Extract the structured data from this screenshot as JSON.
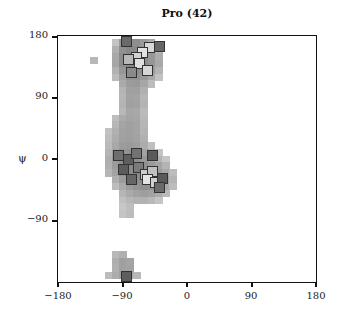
{
  "chart_data": {
    "type": "heatmap",
    "title": "Pro (42)",
    "xlabel": "",
    "ylabel": "ψ",
    "xlim": [
      -180,
      180
    ],
    "ylim": [
      -180,
      180
    ],
    "xticks": [
      -180,
      -90,
      0,
      90,
      180
    ],
    "yticks": [
      180,
      90,
      0,
      -90
    ],
    "cell_size_deg": 10,
    "background_density": [
      {
        "phi": -130,
        "psi": 145,
        "shade": "#b8b8b8"
      },
      {
        "phi": -100,
        "psi": 170,
        "shade": "#c4c4c4"
      },
      {
        "phi": -90,
        "psi": 170,
        "shade": "#9a9a9a"
      },
      {
        "phi": -80,
        "psi": 170,
        "shade": "#8e8e8e"
      },
      {
        "phi": -70,
        "psi": 170,
        "shade": "#8e8e8e"
      },
      {
        "phi": -60,
        "psi": 170,
        "shade": "#9a9a9a"
      },
      {
        "phi": -50,
        "psi": 170,
        "shade": "#a8a8a8"
      },
      {
        "phi": -100,
        "psi": 160,
        "shade": "#b0b0b0"
      },
      {
        "phi": -90,
        "psi": 160,
        "shade": "#909090"
      },
      {
        "phi": -80,
        "psi": 160,
        "shade": "#888888"
      },
      {
        "phi": -70,
        "psi": 160,
        "shade": "#8a8a8a"
      },
      {
        "phi": -60,
        "psi": 160,
        "shade": "#8e8e8e"
      },
      {
        "phi": -50,
        "psi": 160,
        "shade": "#9c9c9c"
      },
      {
        "phi": -40,
        "psi": 160,
        "shade": "#b8b8b8"
      },
      {
        "phi": -100,
        "psi": 150,
        "shade": "#a8a8a8"
      },
      {
        "phi": -90,
        "psi": 150,
        "shade": "#8c8c8c"
      },
      {
        "phi": -80,
        "psi": 150,
        "shade": "#888888"
      },
      {
        "phi": -70,
        "psi": 150,
        "shade": "#8a8a8a"
      },
      {
        "phi": -60,
        "psi": 150,
        "shade": "#8c8c8c"
      },
      {
        "phi": -50,
        "psi": 150,
        "shade": "#989898"
      },
      {
        "phi": -40,
        "psi": 150,
        "shade": "#acacac"
      },
      {
        "phi": -100,
        "psi": 140,
        "shade": "#a6a6a6"
      },
      {
        "phi": -90,
        "psi": 140,
        "shade": "#8c8c8c"
      },
      {
        "phi": -80,
        "psi": 140,
        "shade": "#888888"
      },
      {
        "phi": -70,
        "psi": 140,
        "shade": "#8a8a8a"
      },
      {
        "phi": -60,
        "psi": 140,
        "shade": "#8c8c8c"
      },
      {
        "phi": -50,
        "psi": 140,
        "shade": "#969696"
      },
      {
        "phi": -40,
        "psi": 140,
        "shade": "#a8a8a8"
      },
      {
        "phi": -100,
        "psi": 130,
        "shade": "#b2b2b2"
      },
      {
        "phi": -90,
        "psi": 130,
        "shade": "#969696"
      },
      {
        "phi": -80,
        "psi": 130,
        "shade": "#8c8c8c"
      },
      {
        "phi": -70,
        "psi": 130,
        "shade": "#8c8c8c"
      },
      {
        "phi": -60,
        "psi": 130,
        "shade": "#8e8e8e"
      },
      {
        "phi": -50,
        "psi": 130,
        "shade": "#9e9e9e"
      },
      {
        "phi": -40,
        "psi": 130,
        "shade": "#b4b4b4"
      },
      {
        "phi": -100,
        "psi": 120,
        "shade": "#bcbcbc"
      },
      {
        "phi": -90,
        "psi": 120,
        "shade": "#a0a0a0"
      },
      {
        "phi": -80,
        "psi": 120,
        "shade": "#949494"
      },
      {
        "phi": -70,
        "psi": 120,
        "shade": "#929292"
      },
      {
        "phi": -60,
        "psi": 120,
        "shade": "#989898"
      },
      {
        "phi": -50,
        "psi": 120,
        "shade": "#a8a8a8"
      },
      {
        "phi": -40,
        "psi": 120,
        "shade": "#c2c2c2"
      },
      {
        "phi": -90,
        "psi": 110,
        "shade": "#aaaaaa"
      },
      {
        "phi": -80,
        "psi": 110,
        "shade": "#9c9c9c"
      },
      {
        "phi": -70,
        "psi": 110,
        "shade": "#9a9a9a"
      },
      {
        "phi": -60,
        "psi": 110,
        "shade": "#a6a6a6"
      },
      {
        "phi": -50,
        "psi": 110,
        "shade": "#bcbcbc"
      },
      {
        "phi": -90,
        "psi": 100,
        "shade": "#b4b4b4"
      },
      {
        "phi": -80,
        "psi": 100,
        "shade": "#a0a0a0"
      },
      {
        "phi": -70,
        "psi": 100,
        "shade": "#a0a0a0"
      },
      {
        "phi": -60,
        "psi": 100,
        "shade": "#b0b0b0"
      },
      {
        "phi": -90,
        "psi": 90,
        "shade": "#b6b6b6"
      },
      {
        "phi": -80,
        "psi": 90,
        "shade": "#a2a2a2"
      },
      {
        "phi": -70,
        "psi": 90,
        "shade": "#a4a4a4"
      },
      {
        "phi": -60,
        "psi": 90,
        "shade": "#b6b6b6"
      },
      {
        "phi": -90,
        "psi": 80,
        "shade": "#b4b4b4"
      },
      {
        "phi": -80,
        "psi": 80,
        "shade": "#a0a0a0"
      },
      {
        "phi": -70,
        "psi": 80,
        "shade": "#a2a2a2"
      },
      {
        "phi": -60,
        "psi": 80,
        "shade": "#b4b4b4"
      },
      {
        "phi": -90,
        "psi": 70,
        "shade": "#b8b8b8"
      },
      {
        "phi": -80,
        "psi": 70,
        "shade": "#a6a6a6"
      },
      {
        "phi": -70,
        "psi": 70,
        "shade": "#a8a8a8"
      },
      {
        "phi": -60,
        "psi": 70,
        "shade": "#bababa"
      },
      {
        "phi": -100,
        "psi": 60,
        "shade": "#bebebe"
      },
      {
        "phi": -90,
        "psi": 60,
        "shade": "#aaaaaa"
      },
      {
        "phi": -80,
        "psi": 60,
        "shade": "#a4a4a4"
      },
      {
        "phi": -70,
        "psi": 60,
        "shade": "#a6a6a6"
      },
      {
        "phi": -60,
        "psi": 60,
        "shade": "#b8b8b8"
      },
      {
        "phi": -100,
        "psi": 50,
        "shade": "#b6b6b6"
      },
      {
        "phi": -90,
        "psi": 50,
        "shade": "#a4a4a4"
      },
      {
        "phi": -80,
        "psi": 50,
        "shade": "#a0a0a0"
      },
      {
        "phi": -70,
        "psi": 50,
        "shade": "#a4a4a4"
      },
      {
        "phi": -60,
        "psi": 50,
        "shade": "#b6b6b6"
      },
      {
        "phi": -110,
        "psi": 40,
        "shade": "#c2c2c2"
      },
      {
        "phi": -100,
        "psi": 40,
        "shade": "#b0b0b0"
      },
      {
        "phi": -90,
        "psi": 40,
        "shade": "#a2a2a2"
      },
      {
        "phi": -80,
        "psi": 40,
        "shade": "#a0a0a0"
      },
      {
        "phi": -70,
        "psi": 40,
        "shade": "#a4a4a4"
      },
      {
        "phi": -60,
        "psi": 40,
        "shade": "#b4b4b4"
      },
      {
        "phi": -110,
        "psi": 30,
        "shade": "#bebebe"
      },
      {
        "phi": -100,
        "psi": 30,
        "shade": "#acacac"
      },
      {
        "phi": -90,
        "psi": 30,
        "shade": "#a0a0a0"
      },
      {
        "phi": -80,
        "psi": 30,
        "shade": "#9e9e9e"
      },
      {
        "phi": -70,
        "psi": 30,
        "shade": "#a2a2a2"
      },
      {
        "phi": -60,
        "psi": 30,
        "shade": "#b0b0b0"
      },
      {
        "phi": -110,
        "psi": 20,
        "shade": "#bababa"
      },
      {
        "phi": -100,
        "psi": 20,
        "shade": "#a8a8a8"
      },
      {
        "phi": -90,
        "psi": 20,
        "shade": "#9c9c9c"
      },
      {
        "phi": -80,
        "psi": 20,
        "shade": "#9a9a9a"
      },
      {
        "phi": -70,
        "psi": 20,
        "shade": "#9e9e9e"
      },
      {
        "phi": -60,
        "psi": 20,
        "shade": "#acacac"
      },
      {
        "phi": -50,
        "psi": 20,
        "shade": "#c0c0c0"
      },
      {
        "phi": -110,
        "psi": 10,
        "shade": "#b4b4b4"
      },
      {
        "phi": -100,
        "psi": 10,
        "shade": "#a0a0a0"
      },
      {
        "phi": -90,
        "psi": 10,
        "shade": "#949494"
      },
      {
        "phi": -80,
        "psi": 10,
        "shade": "#929292"
      },
      {
        "phi": -70,
        "psi": 10,
        "shade": "#969696"
      },
      {
        "phi": -60,
        "psi": 10,
        "shade": "#a2a2a2"
      },
      {
        "phi": -50,
        "psi": 10,
        "shade": "#b2b2b2"
      },
      {
        "phi": -40,
        "psi": 10,
        "shade": "#c4c4c4"
      },
      {
        "phi": -110,
        "psi": 0,
        "shade": "#aeaeae"
      },
      {
        "phi": -100,
        "psi": 0,
        "shade": "#9a9a9a"
      },
      {
        "phi": -90,
        "psi": 0,
        "shade": "#8e8e8e"
      },
      {
        "phi": -80,
        "psi": 0,
        "shade": "#8a8a8a"
      },
      {
        "phi": -70,
        "psi": 0,
        "shade": "#8e8e8e"
      },
      {
        "phi": -60,
        "psi": 0,
        "shade": "#989898"
      },
      {
        "phi": -50,
        "psi": 0,
        "shade": "#a6a6a6"
      },
      {
        "phi": -40,
        "psi": 0,
        "shade": "#b4b4b4"
      },
      {
        "phi": -30,
        "psi": 0,
        "shade": "#c6c6c6"
      },
      {
        "phi": -110,
        "psi": -10,
        "shade": "#b0b0b0"
      },
      {
        "phi": -100,
        "psi": -10,
        "shade": "#9c9c9c"
      },
      {
        "phi": -90,
        "psi": -10,
        "shade": "#8e8e8e"
      },
      {
        "phi": -80,
        "psi": -10,
        "shade": "#888888"
      },
      {
        "phi": -70,
        "psi": -10,
        "shade": "#8a8a8a"
      },
      {
        "phi": -60,
        "psi": -10,
        "shade": "#909090"
      },
      {
        "phi": -50,
        "psi": -10,
        "shade": "#9a9a9a"
      },
      {
        "phi": -40,
        "psi": -10,
        "shade": "#a4a4a4"
      },
      {
        "phi": -30,
        "psi": -10,
        "shade": "#b4b4b4"
      },
      {
        "phi": -110,
        "psi": -20,
        "shade": "#b6b6b6"
      },
      {
        "phi": -100,
        "psi": -20,
        "shade": "#a2a2a2"
      },
      {
        "phi": -90,
        "psi": -20,
        "shade": "#929292"
      },
      {
        "phi": -80,
        "psi": -20,
        "shade": "#8a8a8a"
      },
      {
        "phi": -70,
        "psi": -20,
        "shade": "#8a8a8a"
      },
      {
        "phi": -60,
        "psi": -20,
        "shade": "#8c8c8c"
      },
      {
        "phi": -50,
        "psi": -20,
        "shade": "#929292"
      },
      {
        "phi": -40,
        "psi": -20,
        "shade": "#9c9c9c"
      },
      {
        "phi": -30,
        "psi": -20,
        "shade": "#a8a8a8"
      },
      {
        "phi": -20,
        "psi": -20,
        "shade": "#bcbcbc"
      },
      {
        "phi": -100,
        "psi": -30,
        "shade": "#aeaeae"
      },
      {
        "phi": -90,
        "psi": -30,
        "shade": "#9c9c9c"
      },
      {
        "phi": -80,
        "psi": -30,
        "shade": "#909090"
      },
      {
        "phi": -70,
        "psi": -30,
        "shade": "#8c8c8c"
      },
      {
        "phi": -60,
        "psi": -30,
        "shade": "#8a8a8a"
      },
      {
        "phi": -50,
        "psi": -30,
        "shade": "#8e8e8e"
      },
      {
        "phi": -40,
        "psi": -30,
        "shade": "#969696"
      },
      {
        "phi": -30,
        "psi": -30,
        "shade": "#a2a2a2"
      },
      {
        "phi": -20,
        "psi": -30,
        "shade": "#b4b4b4"
      },
      {
        "phi": -100,
        "psi": -40,
        "shade": "#bcbcbc"
      },
      {
        "phi": -90,
        "psi": -40,
        "shade": "#aaaaaa"
      },
      {
        "phi": -80,
        "psi": -40,
        "shade": "#9c9c9c"
      },
      {
        "phi": -70,
        "psi": -40,
        "shade": "#949494"
      },
      {
        "phi": -60,
        "psi": -40,
        "shade": "#909090"
      },
      {
        "phi": -50,
        "psi": -40,
        "shade": "#929292"
      },
      {
        "phi": -40,
        "psi": -40,
        "shade": "#9a9a9a"
      },
      {
        "phi": -30,
        "psi": -40,
        "shade": "#a8a8a8"
      },
      {
        "phi": -20,
        "psi": -40,
        "shade": "#bcbcbc"
      },
      {
        "phi": -90,
        "psi": -50,
        "shade": "#b6b6b6"
      },
      {
        "phi": -80,
        "psi": -50,
        "shade": "#aaaaaa"
      },
      {
        "phi": -70,
        "psi": -50,
        "shade": "#a2a2a2"
      },
      {
        "phi": -60,
        "psi": -50,
        "shade": "#9e9e9e"
      },
      {
        "phi": -50,
        "psi": -50,
        "shade": "#a2a2a2"
      },
      {
        "phi": -40,
        "psi": -50,
        "shade": "#acacac"
      },
      {
        "phi": -30,
        "psi": -50,
        "shade": "#bababa"
      },
      {
        "phi": -90,
        "psi": -60,
        "shade": "#c0c0c0"
      },
      {
        "phi": -80,
        "psi": -60,
        "shade": "#b6b6b6"
      },
      {
        "phi": -70,
        "psi": -60,
        "shade": "#b2b2b2"
      },
      {
        "phi": -60,
        "psi": -60,
        "shade": "#b2b2b2"
      },
      {
        "phi": -50,
        "psi": -60,
        "shade": "#b8b8b8"
      },
      {
        "phi": -40,
        "psi": -60,
        "shade": "#c4c4c4"
      },
      {
        "phi": -90,
        "psi": -70,
        "shade": "#c6c6c6"
      },
      {
        "phi": -80,
        "psi": -70,
        "shade": "#bebebe"
      },
      {
        "phi": -90,
        "psi": -80,
        "shade": "#c4c4c4"
      },
      {
        "phi": -80,
        "psi": -80,
        "shade": "#bcbcbc"
      },
      {
        "phi": -100,
        "psi": -140,
        "shade": "#b8b8b8"
      },
      {
        "phi": -90,
        "psi": -140,
        "shade": "#b0b0b0"
      },
      {
        "phi": -100,
        "psi": -150,
        "shade": "#aeaeae"
      },
      {
        "phi": -90,
        "psi": -150,
        "shade": "#a0a0a0"
      },
      {
        "phi": -80,
        "psi": -150,
        "shade": "#a4a4a4"
      },
      {
        "phi": -100,
        "psi": -160,
        "shade": "#b0b0b0"
      },
      {
        "phi": -90,
        "psi": -160,
        "shade": "#a0a0a0"
      },
      {
        "phi": -80,
        "psi": -160,
        "shade": "#a2a2a2"
      },
      {
        "phi": -110,
        "psi": -170,
        "shade": "#bcbcbc"
      },
      {
        "phi": -100,
        "psi": -170,
        "shade": "#acacac"
      },
      {
        "phi": -90,
        "psi": -170,
        "shade": "#a0a0a0"
      },
      {
        "phi": -80,
        "psi": -170,
        "shade": "#a6a6a6"
      },
      {
        "phi": -70,
        "psi": -170,
        "shade": "#b8b8b8"
      }
    ],
    "highlight_squares": [
      {
        "phi": -85,
        "psi": 172,
        "fill": "#6a6a6a"
      },
      {
        "phi": -52,
        "psi": 163,
        "fill": "#d8d8d8"
      },
      {
        "phi": -38,
        "psi": 165,
        "fill": "#666666"
      },
      {
        "phi": -62,
        "psi": 156,
        "fill": "#e2e2e2"
      },
      {
        "phi": -70,
        "psi": 148,
        "fill": "#d2d2d2"
      },
      {
        "phi": -82,
        "psi": 146,
        "fill": "#b8b8b8"
      },
      {
        "phi": -66,
        "psi": 140,
        "fill": "#e0e0e0"
      },
      {
        "phi": -55,
        "psi": 130,
        "fill": "#d6d6d6"
      },
      {
        "phi": -78,
        "psi": 127,
        "fill": "#8a8a8a"
      },
      {
        "phi": -95,
        "psi": 5,
        "fill": "#6e6e6e"
      },
      {
        "phi": -82,
        "psi": 0,
        "fill": "#5e5e5e"
      },
      {
        "phi": -70,
        "psi": 8,
        "fill": "#727272"
      },
      {
        "phi": -48,
        "psi": 5,
        "fill": "#5a5a5a"
      },
      {
        "phi": -88,
        "psi": -15,
        "fill": "#5c5c5c"
      },
      {
        "phi": -68,
        "psi": -12,
        "fill": "#7a7a7a"
      },
      {
        "phi": -58,
        "psi": -22,
        "fill": "#cccccc"
      },
      {
        "phi": -48,
        "psi": -18,
        "fill": "#c0c0c0"
      },
      {
        "phi": -55,
        "psi": -30,
        "fill": "#e4e4e4"
      },
      {
        "phi": -44,
        "psi": -35,
        "fill": "#d0d0d0"
      },
      {
        "phi": -34,
        "psi": -28,
        "fill": "#5a5a5a"
      },
      {
        "phi": -38,
        "psi": -42,
        "fill": "#6a6a6a"
      },
      {
        "phi": -78,
        "psi": -30,
        "fill": "#666666"
      },
      {
        "phi": -85,
        "psi": -175,
        "fill": "#5e5e5e"
      }
    ]
  },
  "axes": {
    "title": "Pro (42)",
    "ylabel": "ψ",
    "xtick_labels": [
      "−180",
      "−90",
      "0",
      "90",
      "180"
    ],
    "ytick_labels": [
      "180",
      "90",
      "0",
      "−90"
    ]
  }
}
